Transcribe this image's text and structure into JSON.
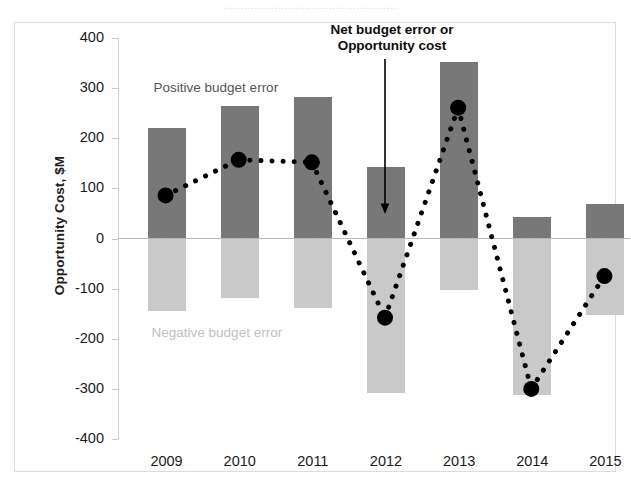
{
  "caption": {
    "text": "……………………………………………"
  },
  "annotation": {
    "line1": "Net budget error or",
    "line2": "Opportunity cost"
  },
  "labels": {
    "positive_budget_error": "Positive budget error",
    "negative_budget_error": "Negative budget error"
  },
  "colors": {
    "positive_bar": "#787878",
    "negative_bar": "#c9c9c9",
    "net_line": "#000000",
    "axis": "#c9c9c9",
    "zero_line": "#b9b9b9",
    "positive_label": "#555555",
    "negative_label": "#c0c0c0"
  },
  "chart_data": {
    "type": "bar",
    "title": "",
    "xlabel": "",
    "ylabel": "Opportunity Cost, $M",
    "ylim": [
      -400,
      400
    ],
    "ytick_values": [
      400,
      300,
      200,
      100,
      0,
      -100,
      -200,
      -300,
      -400
    ],
    "ytick_labels": [
      "400",
      "300",
      "200",
      "100",
      "0",
      "-100",
      "-200",
      "-300",
      "-400"
    ],
    "grid": false,
    "legend": "none",
    "categories": [
      "2009",
      "2010",
      "2011",
      "2012",
      "2013",
      "2014",
      "2015"
    ],
    "series": [
      {
        "name": "Positive budget error",
        "type": "bar",
        "color": "#787878",
        "values": [
          220,
          265,
          282,
          143,
          352,
          42,
          68
        ]
      },
      {
        "name": "Negative budget error",
        "type": "bar",
        "color": "#c9c9c9",
        "values": [
          -145,
          -118,
          -138,
          -308,
          -103,
          -313,
          -152
        ]
      },
      {
        "name": "Net budget error or Opportunity cost",
        "type": "line",
        "style": "dotted",
        "marker": "circle",
        "color": "#000000",
        "values": [
          84,
          155,
          150,
          -160,
          259,
          -302,
          -77
        ]
      }
    ]
  }
}
